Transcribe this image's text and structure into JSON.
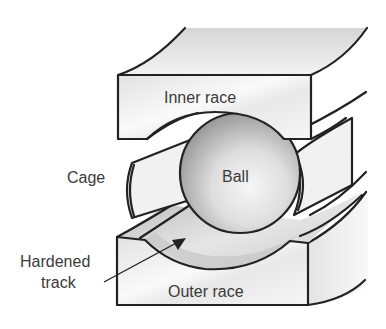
{
  "diagram": {
    "labels": {
      "inner_race": "Inner race",
      "ball": "Ball",
      "cage": "Cage",
      "hardened_track_line1": "Hardened",
      "hardened_track_line2": "track",
      "outer_race": "Outer race"
    },
    "components": [
      {
        "id": "inner-race",
        "label": "Inner race"
      },
      {
        "id": "ball",
        "label": "Ball"
      },
      {
        "id": "cage",
        "label": "Cage"
      },
      {
        "id": "hardened-track",
        "label": "Hardened track"
      },
      {
        "id": "outer-race",
        "label": "Outer race"
      }
    ],
    "colors": {
      "stroke": "#222222",
      "face_light": "#f4f4f4",
      "face_mid": "#dcdcdc",
      "ball_light": "#f2f2f2",
      "ball_dark": "#8f8f8f",
      "text": "#3a3a3a"
    }
  }
}
